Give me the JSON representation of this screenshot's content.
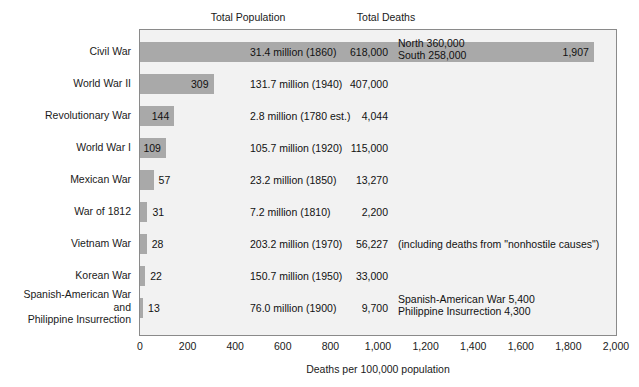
{
  "chart_data": {
    "type": "bar",
    "title": "",
    "xlabel": "Deaths per 100,000 population",
    "ylabel": "",
    "xlim": [
      0,
      2000
    ],
    "grid": false,
    "legend": "none",
    "orientation": "horizontal",
    "columns": {
      "population_header": "Total Population",
      "deaths_header": "Total Deaths"
    },
    "axis_ticks": [
      {
        "value": 0,
        "label": "0"
      },
      {
        "value": 200,
        "label": "200"
      },
      {
        "value": 400,
        "label": "400"
      },
      {
        "value": 600,
        "label": "600"
      },
      {
        "value": 800,
        "label": "800"
      },
      {
        "value": 1000,
        "label": "1,000"
      },
      {
        "value": 1200,
        "label": "1,200"
      },
      {
        "value": 1400,
        "label": "1,400"
      },
      {
        "value": 1600,
        "label": "1,600"
      },
      {
        "value": 1800,
        "label": "1,800"
      },
      {
        "value": 2000,
        "label": "2,000"
      }
    ],
    "categories": [
      "Civil War",
      "World War II",
      "Revolutionary War",
      "World War I",
      "Mexican War",
      "War of 1812",
      "Vietnam War",
      "Korean War",
      "Spanish-American War and Philippine Insurrection"
    ],
    "values": [
      1907,
      309,
      144,
      109,
      57,
      31,
      28,
      22,
      13
    ],
    "rows": [
      {
        "label_lines": [
          "Civil War"
        ],
        "value": 1907,
        "value_label": "1,907",
        "value_inside": true,
        "total_population": "31.4 million (1860)",
        "total_deaths": "618,000",
        "note_lines": [
          "North 360,000",
          "South 258,000"
        ]
      },
      {
        "label_lines": [
          "World War II"
        ],
        "value": 309,
        "value_label": "309",
        "value_inside": true,
        "total_population": "131.7 million (1940)",
        "total_deaths": "407,000",
        "note_lines": []
      },
      {
        "label_lines": [
          "Revolutionary War"
        ],
        "value": 144,
        "value_label": "144",
        "value_inside": true,
        "total_population": "2.8 million (1780 est.)",
        "total_deaths": "4,044",
        "note_lines": []
      },
      {
        "label_lines": [
          "World War I"
        ],
        "value": 109,
        "value_label": "109",
        "value_inside": true,
        "total_population": "105.7 million (1920)",
        "total_deaths": "115,000",
        "note_lines": []
      },
      {
        "label_lines": [
          "Mexican War"
        ],
        "value": 57,
        "value_label": "57",
        "value_inside": false,
        "total_population": "23.2 million (1850)",
        "total_deaths": "13,270",
        "note_lines": []
      },
      {
        "label_lines": [
          "War of 1812"
        ],
        "value": 31,
        "value_label": "31",
        "value_inside": false,
        "total_population": "7.2 million (1810)",
        "total_deaths": "2,200",
        "note_lines": []
      },
      {
        "label_lines": [
          "Vietnam War"
        ],
        "value": 28,
        "value_label": "28",
        "value_inside": false,
        "total_population": "203.2 million (1970)",
        "total_deaths": "56,227",
        "note_lines": [
          "(including deaths from \"nonhostile causes\")"
        ]
      },
      {
        "label_lines": [
          "Korean War"
        ],
        "value": 22,
        "value_label": "22",
        "value_inside": false,
        "total_population": "150.7 million (1950)",
        "total_deaths": "33,000",
        "note_lines": []
      },
      {
        "label_lines": [
          "Spanish-American War",
          "and",
          "Philippine Insurrection"
        ],
        "value": 13,
        "value_label": "13",
        "value_inside": false,
        "total_population": "76.0 million (1900)",
        "total_deaths": "9,700",
        "note_lines": [
          "Spanish-American War 5,400",
          "Philippine Insurrection 4,300"
        ]
      }
    ],
    "colors": {
      "bar": "#a9a9a9",
      "plot_background": "#f2f2f2",
      "frame": "#8a8a8a",
      "text": "#111111",
      "page_background": "#ffffff"
    }
  }
}
